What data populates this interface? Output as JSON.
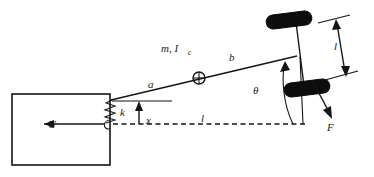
{
  "figure": {
    "title": "",
    "type": "free-body-diagram"
  },
  "labels": {
    "input_force": "U",
    "spring_constant": "k",
    "displacement": "x",
    "distance_a": "a",
    "distance_b": "b",
    "length_l_horizontal": "l",
    "length_l_axle": "l",
    "mass_inertia": "m, I",
    "mass_inertia_subscript": "c",
    "angle_theta": "θ",
    "force_F": "F"
  },
  "colors": {
    "line": "#151515",
    "wheel": "#0d0d0d",
    "background": "#ffffff",
    "text": "#1a1a1a"
  },
  "components": {
    "cart_name": "cart-body",
    "spring_name": "coil-spring",
    "beam_name": "inclined-beam",
    "center_of_mass_name": "center-of-mass-marker",
    "axle_name": "wheel-axle",
    "wheel_upper_name": "upper-wheel",
    "wheel_lower_name": "lower-wheel",
    "ground_line_name": "horizontal-reference-line"
  },
  "geometry": {
    "cart": {
      "x": 12,
      "y": 94,
      "width": 98,
      "height": 71
    },
    "beam": {
      "x1": 111,
      "y1": 100,
      "x2": 297,
      "y2": 56
    },
    "pivot": {
      "x": 111,
      "y": 100
    },
    "center_of_mass": {
      "x": 199,
      "y": 78,
      "r": 6
    },
    "axle": {
      "x1": 296,
      "y1": 22,
      "x2": 305,
      "y2": 94
    },
    "reference_line": {
      "x1": 113,
      "y1": 124,
      "x2": 306,
      "y2": 124
    },
    "theta_arc_radius": 62
  }
}
